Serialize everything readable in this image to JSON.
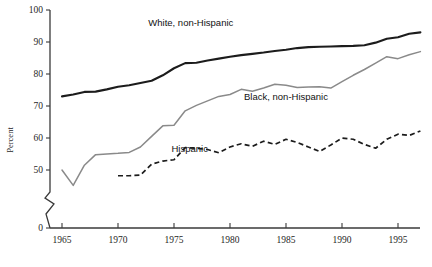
{
  "chart_data": {
    "type": "line",
    "title": "",
    "xlabel": "",
    "ylabel": "Percent",
    "xlim": [
      1964.2,
      1997.4
    ],
    "ylim": [
      47,
      100
    ],
    "grid": false,
    "legend": "inline-annotations",
    "y_axis_break": true,
    "y_axis_break_note": "axis broken between 0 and 50",
    "xticks": [
      1965,
      1970,
      1975,
      1980,
      1985,
      1990,
      1995
    ],
    "xtick_labels": [
      "1965",
      "1970",
      "1975",
      "1980",
      "1985",
      "1990",
      "1995"
    ],
    "yticks": [
      0,
      50,
      60,
      70,
      80,
      90,
      100
    ],
    "ytick_labels": [
      "0",
      "50",
      "60",
      "70",
      "80",
      "90",
      "100"
    ],
    "series": [
      {
        "name": "White, non-Hispanic",
        "style": "solid-thick-black",
        "color": "#1c1c1c",
        "label_x": 1976.5,
        "label_y": 95.0,
        "x": [
          1965,
          1966,
          1967,
          1968,
          1969,
          1970,
          1971,
          1972,
          1973,
          1974,
          1975,
          1976,
          1977,
          1978,
          1979,
          1980,
          1981,
          1982,
          1983,
          1984,
          1985,
          1986,
          1987,
          1988,
          1989,
          1990,
          1991,
          1992,
          1993,
          1994,
          1995,
          1996,
          1997
        ],
        "y": [
          73.0,
          73.6,
          74.4,
          74.5,
          75.2,
          76.0,
          76.5,
          77.2,
          77.9,
          79.6,
          81.8,
          83.4,
          83.5,
          84.2,
          84.8,
          85.4,
          85.9,
          86.3,
          86.7,
          87.2,
          87.6,
          88.1,
          88.4,
          88.5,
          88.6,
          88.7,
          88.8,
          89.0,
          89.8,
          91.0,
          91.5,
          92.6,
          93.0
        ]
      },
      {
        "name": "Black, non-Hispanic",
        "style": "solid-thin-gray",
        "color": "#8a8a8a",
        "label_x": 1985.0,
        "label_y": 72.0,
        "x": [
          1965,
          1966,
          1967,
          1968,
          1969,
          1970,
          1971,
          1972,
          1973,
          1974,
          1975,
          1976,
          1977,
          1978,
          1979,
          1980,
          1981,
          1982,
          1983,
          1984,
          1985,
          1986,
          1987,
          1988,
          1989,
          1990,
          1991,
          1992,
          1993,
          1994,
          1995,
          1996,
          1997
        ],
        "y": [
          50.0,
          45.2,
          51.5,
          54.8,
          55.0,
          55.2,
          55.5,
          57.2,
          60.5,
          63.8,
          64.0,
          68.5,
          70.2,
          71.6,
          73.0,
          73.6,
          75.2,
          74.6,
          75.6,
          76.8,
          76.5,
          75.8,
          75.9,
          76.0,
          75.6,
          77.6,
          79.6,
          81.4,
          83.4,
          85.4,
          84.8,
          86.0,
          87.0
        ]
      },
      {
        "name": "Hispanic",
        "style": "dashed-black",
        "color": "#1c1c1c",
        "label_x": 1976.4,
        "label_y": 55.6,
        "x": [
          1970,
          1971,
          1972,
          1973,
          1974,
          1975,
          1976,
          1977,
          1978,
          1979,
          1980,
          1981,
          1982,
          1983,
          1984,
          1985,
          1986,
          1987,
          1988,
          1989,
          1990,
          1991,
          1992,
          1993,
          1994,
          1995,
          1996,
          1997
        ],
        "y": [
          48.2,
          48.2,
          48.4,
          51.8,
          52.8,
          53.2,
          57.0,
          56.8,
          56.4,
          55.4,
          57.2,
          58.2,
          57.4,
          59.0,
          58.0,
          59.6,
          58.6,
          57.2,
          55.8,
          57.8,
          60.0,
          59.6,
          58.0,
          56.8,
          59.6,
          61.2,
          60.8,
          62.2
        ]
      }
    ]
  },
  "labels": {
    "ylabel": "Percent",
    "white": "White, non-Hispanic",
    "black": "Black, non-Hispanic",
    "hispanic": "Hispanic"
  },
  "caption": {
    "text": ""
  }
}
